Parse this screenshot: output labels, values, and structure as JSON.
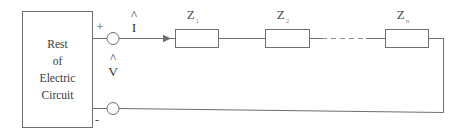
{
  "diagram": {
    "source_box": {
      "lines": [
        "Rest",
        "of",
        "Electric",
        "Circuit"
      ]
    },
    "terminals": {
      "positive_sign": "+",
      "negative_sign": "-"
    },
    "labels": {
      "current": "I",
      "current_hat": "^",
      "voltage": "V",
      "voltage_hat": "^"
    },
    "impedances": [
      {
        "symbol": "Z",
        "subscript": "1"
      },
      {
        "symbol": "Z",
        "subscript": "2"
      },
      {
        "symbol": "Z",
        "subscript": "n"
      }
    ],
    "ellipsis_label": "- - - - -",
    "colors": {
      "wire": "#6f6f6f",
      "text": "#3a3a3a",
      "background": "#ffffff",
      "dashed": "#8a8a8a"
    }
  }
}
